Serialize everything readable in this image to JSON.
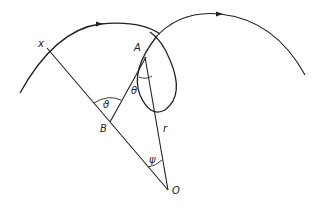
{
  "diagram": {
    "title": "",
    "labels": {
      "x": "x",
      "A": "A",
      "B": "B",
      "O": "O",
      "r": "r",
      "theta": "θ",
      "vartheta": "ϑ",
      "psi": "ψ"
    },
    "colors": {
      "line": "#222222",
      "background": "#ffffff"
    }
  }
}
